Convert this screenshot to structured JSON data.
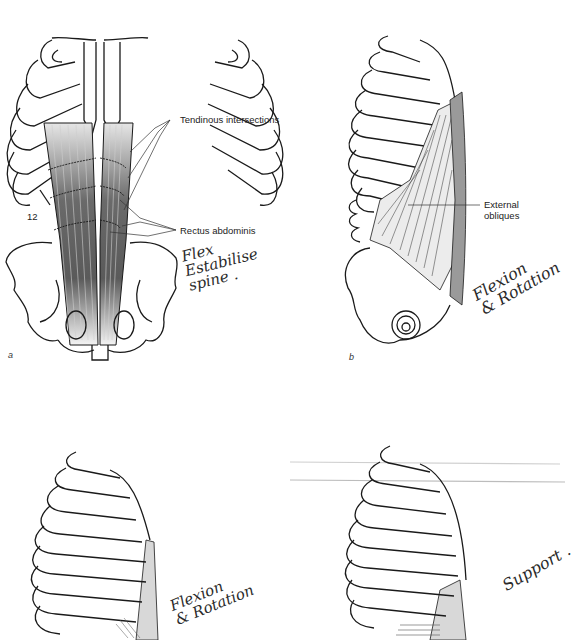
{
  "page": {
    "type": "scanned anatomy figure page",
    "background": "#ffffff"
  },
  "figures": [
    {
      "id": "a",
      "letter": "a",
      "view": "anterior view of thorax and pelvis",
      "labels": {
        "tendinous": "Tendinous intersections",
        "rectus": "Rectus abdominis",
        "rib_number": "12"
      },
      "handwritten_note": "Flex\nEstabilise\nspine ."
    },
    {
      "id": "b",
      "letter": "b",
      "view": "lateral view of thorax and pelvis",
      "labels": {
        "external": "External\nobliques"
      },
      "handwritten_note": "Flexion\n& Rotation"
    },
    {
      "id": "c",
      "view": "lateral view of ribcage (partial)",
      "handwritten_note": "Flexion\n& Rotation"
    },
    {
      "id": "d",
      "view": "lateral view of ribcage (partial)",
      "handwritten_note": "Support ."
    }
  ],
  "colors": {
    "line": "#1a1a1a",
    "muscle_dark": "#555555",
    "muscle_light": "#d8d8d8",
    "sheath": "#9a9a9a"
  }
}
